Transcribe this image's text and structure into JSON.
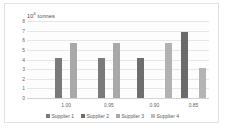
{
  "chart_data": {
    "type": "bar",
    "title": "",
    "axis_title": "10⁶ tonnes",
    "axis_title_base": "10",
    "axis_title_exp": "6",
    "axis_title_unit": " tonnes",
    "xlabel": "",
    "ylabel": "10⁶ tonnes",
    "ylim": [
      0,
      8
    ],
    "yticks": [
      0,
      1,
      2,
      3,
      4,
      5,
      6,
      7,
      8
    ],
    "ytick_labels": [
      "0",
      "1",
      "2",
      "3",
      "4",
      "5",
      "6",
      "7",
      "8"
    ],
    "grid": true,
    "legend_position": "bottom",
    "categories": [
      "1.00",
      "0.95",
      "0.90",
      "0.85"
    ],
    "series": [
      {
        "name": "Supplier 1",
        "color": "#7a7a7a",
        "values": [
          4.15,
          4.15,
          4.15,
          null
        ]
      },
      {
        "name": "Supplier 2",
        "color": "#6f6f6f",
        "values": [
          null,
          null,
          null,
          6.9
        ]
      },
      {
        "name": "Supplier 3",
        "color": "#a8a8a8",
        "values": [
          5.75,
          5.75,
          5.75,
          null
        ]
      },
      {
        "name": "Supplier 4",
        "color": "#b4b4b4",
        "values": [
          null,
          null,
          null,
          3.1
        ]
      }
    ],
    "bars": [
      {
        "group": "1.00",
        "series": "Supplier 1",
        "value": 4.15,
        "color": "#7a7a7a",
        "x_pct": 17.5
      },
      {
        "group": "1.00",
        "series": "Supplier 3",
        "value": 5.75,
        "color": "#a9a9a9",
        "x_pct": 25.5
      },
      {
        "group": "0.95",
        "series": "Supplier 1",
        "value": 4.15,
        "color": "#7a7a7a",
        "x_pct": 41.0
      },
      {
        "group": "0.95",
        "series": "Supplier 3",
        "value": 5.75,
        "color": "#a9a9a9",
        "x_pct": 49.0
      },
      {
        "group": "0.90",
        "series": "Supplier 1",
        "value": 4.15,
        "color": "#6e6e6e",
        "x_pct": 62.5
      },
      {
        "group": "0.90",
        "series": "Supplier 3",
        "value": 5.75,
        "color": "#b2b2b2",
        "x_pct": 78.0
      },
      {
        "group": "0.85",
        "series": "Supplier 2",
        "value": 6.9,
        "color": "#6b6b6b",
        "x_pct": 86.5
      },
      {
        "group": "0.85",
        "series": "Supplier 4",
        "value": 3.1,
        "color": "#b4b4b4",
        "x_pct": 96.5
      }
    ],
    "legend": [
      {
        "label": "Supplier 1",
        "color": "#7a7a7a"
      },
      {
        "label": "Supplier 2",
        "color": "#6f6f6f"
      },
      {
        "label": "Supplier 3",
        "color": "#a8a8a8"
      },
      {
        "label": "Supplier 4",
        "color": "#bcbcbc"
      }
    ],
    "colors": {
      "grid": "#e6e6e6",
      "axis": "#d2d2d2",
      "text": "#666666",
      "plot_background": "#fdfdfd",
      "frame_border": "#e2e2e2"
    }
  }
}
